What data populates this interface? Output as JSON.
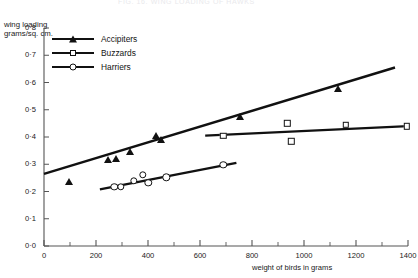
{
  "figure": {
    "clipped_caption": "FIG. 16.  WING LOADING  OF  HAWKS"
  },
  "chart_data": {
    "type": "scatter",
    "title": "",
    "xlabel": "weight of birds in grams",
    "ylabel": "wing loading\ngrams/sq. cm.",
    "xlim": [
      0,
      1400
    ],
    "ylim": [
      0.0,
      0.8
    ],
    "xticks": [
      0,
      200,
      400,
      600,
      800,
      1000,
      1200,
      1400
    ],
    "xtick_labels": [
      "0",
      "200",
      "400",
      "600",
      "800",
      "1000",
      "1200",
      "1400"
    ],
    "xminor_step": 100,
    "yticks": [
      0.0,
      0.1,
      0.2,
      0.3,
      0.4,
      0.5,
      0.6,
      0.7,
      0.8
    ],
    "ytick_labels": [
      "0·0",
      "0·1",
      "0·2",
      "0·3",
      "0·4",
      "0·5",
      "0·6",
      "0·7",
      "0·8"
    ],
    "grid": false,
    "legend_position": "top-left",
    "series": [
      {
        "name": "Accipiters",
        "marker": "filled-triangle",
        "color": "#111111",
        "points": [
          {
            "x": 95,
            "y": 0.235
          },
          {
            "x": 245,
            "y": 0.315
          },
          {
            "x": 275,
            "y": 0.32
          },
          {
            "x": 330,
            "y": 0.345
          },
          {
            "x": 430,
            "y": 0.405
          },
          {
            "x": 450,
            "y": 0.39
          },
          {
            "x": 755,
            "y": 0.475
          },
          {
            "x": 1130,
            "y": 0.575
          }
        ],
        "fit_line": {
          "x0": 0,
          "y0": 0.265,
          "x1": 1350,
          "y1": 0.655
        }
      },
      {
        "name": "Buzzards",
        "marker": "open-square",
        "color": "#111111",
        "points": [
          {
            "x": 690,
            "y": 0.405
          },
          {
            "x": 935,
            "y": 0.45
          },
          {
            "x": 950,
            "y": 0.385
          },
          {
            "x": 1160,
            "y": 0.445
          },
          {
            "x": 1395,
            "y": 0.44
          }
        ],
        "fit_line": {
          "x0": 620,
          "y0": 0.405,
          "x1": 1400,
          "y1": 0.44
        }
      },
      {
        "name": "Harriers",
        "marker": "open-circle",
        "color": "#111111",
        "points": [
          {
            "x": 270,
            "y": 0.218
          },
          {
            "x": 295,
            "y": 0.217
          },
          {
            "x": 345,
            "y": 0.24
          },
          {
            "x": 380,
            "y": 0.262
          },
          {
            "x": 400,
            "y": 0.232
          },
          {
            "x": 470,
            "y": 0.253
          },
          {
            "x": 690,
            "y": 0.298
          }
        ],
        "fit_line": {
          "x0": 215,
          "y0": 0.208,
          "x1": 740,
          "y1": 0.305
        }
      }
    ]
  }
}
